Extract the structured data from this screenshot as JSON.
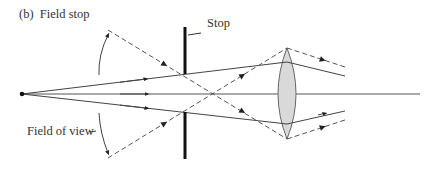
{
  "title": "(b)  Field stop",
  "labels": {
    "stop": "Stop",
    "field_of_view": "Field of view"
  },
  "elements": {
    "source": "point-source",
    "stop": "aperture-stop",
    "lens": "converging-lens",
    "axis": "optical-axis"
  },
  "colors": {
    "line": "#444444",
    "stop": "#111111",
    "lens_fill": "#d9d9d9",
    "lens_stroke": "#666666"
  }
}
